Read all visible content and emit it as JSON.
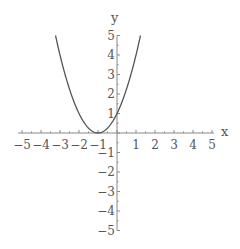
{
  "chart_data": {
    "type": "line",
    "title": "",
    "xlabel": "x",
    "ylabel": "y",
    "xlim": [
      -5,
      5
    ],
    "ylim": [
      -5,
      5
    ],
    "grid": false,
    "legend": null,
    "x_ticks": [
      -5,
      -4,
      -3,
      -2,
      -1,
      1,
      2,
      3,
      4,
      5
    ],
    "y_ticks": [
      -5,
      -4,
      -3,
      -2,
      -1,
      1,
      2,
      3,
      4,
      5
    ],
    "series": [
      {
        "name": "y = (x+1)^2",
        "function": "(x+1)^2",
        "x": [
          -3.236,
          -3,
          -2.5,
          -2,
          -1.5,
          -1,
          -0.5,
          0,
          0.5,
          1,
          1.236
        ],
        "values": [
          5,
          4,
          2.25,
          1,
          0.25,
          0,
          0.25,
          1,
          2.25,
          4,
          5
        ],
        "color": "#555555"
      }
    ]
  },
  "colors": {
    "axis": "#888888",
    "curve": "#555555",
    "text": "#555555",
    "background": "#ffffff"
  }
}
